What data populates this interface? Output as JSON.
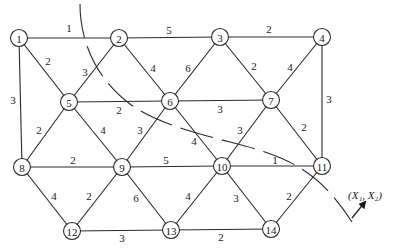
{
  "figure": {
    "type": "weighted-graph",
    "nodes": [
      {
        "id": "1",
        "x": 19,
        "y": 38
      },
      {
        "id": "2",
        "x": 119,
        "y": 38
      },
      {
        "id": "3",
        "x": 220,
        "y": 37
      },
      {
        "id": "4",
        "x": 322,
        "y": 37
      },
      {
        "id": "5",
        "x": 69,
        "y": 102
      },
      {
        "id": "6",
        "x": 170,
        "y": 101
      },
      {
        "id": "7",
        "x": 271,
        "y": 100
      },
      {
        "id": "8",
        "x": 22,
        "y": 167
      },
      {
        "id": "9",
        "x": 122,
        "y": 167
      },
      {
        "id": "10",
        "x": 222,
        "y": 166
      },
      {
        "id": "11",
        "x": 322,
        "y": 166
      },
      {
        "id": "12",
        "x": 72,
        "y": 231
      },
      {
        "id": "13",
        "x": 171,
        "y": 230
      },
      {
        "id": "14",
        "x": 271,
        "y": 229
      }
    ],
    "edges": [
      {
        "from": "1",
        "to": "2",
        "weight": "1",
        "lx": 69,
        "ly": 28
      },
      {
        "from": "2",
        "to": "3",
        "weight": "5",
        "lx": 169,
        "ly": 30
      },
      {
        "from": "3",
        "to": "4",
        "weight": "2",
        "lx": 269,
        "ly": 29
      },
      {
        "from": "1",
        "to": "5",
        "weight": "2",
        "lx": 48,
        "ly": 61
      },
      {
        "from": "2",
        "to": "5",
        "weight": "3",
        "lx": 85,
        "ly": 72
      },
      {
        "from": "2",
        "to": "6",
        "weight": "4",
        "lx": 153,
        "ly": 68
      },
      {
        "from": "3",
        "to": "6",
        "weight": "6",
        "lx": 188,
        "ly": 68
      },
      {
        "from": "3",
        "to": "7",
        "weight": "2",
        "lx": 254,
        "ly": 66
      },
      {
        "from": "4",
        "to": "7",
        "weight": "4",
        "lx": 290,
        "ly": 67
      },
      {
        "from": "1",
        "to": "8",
        "weight": "3",
        "lx": 13,
        "ly": 100
      },
      {
        "from": "4",
        "to": "11",
        "weight": "3",
        "lx": 329,
        "ly": 99
      },
      {
        "from": "5",
        "to": "6",
        "weight": "2",
        "lx": 119,
        "ly": 110
      },
      {
        "from": "6",
        "to": "7",
        "weight": "3",
        "lx": 220,
        "ly": 109
      },
      {
        "from": "5",
        "to": "8",
        "weight": "2",
        "lx": 39,
        "ly": 130
      },
      {
        "from": "5",
        "to": "9",
        "weight": "4",
        "lx": 103,
        "ly": 130
      },
      {
        "from": "6",
        "to": "9",
        "weight": "3",
        "lx": 140,
        "ly": 130
      },
      {
        "from": "6",
        "to": "10",
        "weight": "4",
        "lx": 194,
        "ly": 141
      },
      {
        "from": "7",
        "to": "10",
        "weight": "3",
        "lx": 240,
        "ly": 130
      },
      {
        "from": "7",
        "to": "11",
        "weight": "2",
        "lx": 304,
        "ly": 127
      },
      {
        "from": "8",
        "to": "9",
        "weight": "2",
        "lx": 73,
        "ly": 160
      },
      {
        "from": "9",
        "to": "10",
        "weight": "5",
        "lx": 166,
        "ly": 160
      },
      {
        "from": "10",
        "to": "11",
        "weight": "1",
        "lx": 275,
        "ly": 160
      },
      {
        "from": "8",
        "to": "12",
        "weight": "4",
        "lx": 54,
        "ly": 196
      },
      {
        "from": "9",
        "to": "12",
        "weight": "2",
        "lx": 89,
        "ly": 196
      },
      {
        "from": "9",
        "to": "13",
        "weight": "6",
        "lx": 136,
        "ly": 198
      },
      {
        "from": "10",
        "to": "13",
        "weight": "4",
        "lx": 188,
        "ly": 196
      },
      {
        "from": "10",
        "to": "14",
        "weight": "3",
        "lx": 236,
        "ly": 198
      },
      {
        "from": "11",
        "to": "14",
        "weight": "2",
        "lx": 289,
        "ly": 196
      },
      {
        "from": "12",
        "to": "13",
        "weight": "3",
        "lx": 122,
        "ly": 238
      },
      {
        "from": "13",
        "to": "14",
        "weight": "2",
        "lx": 221,
        "ly": 237
      }
    ],
    "cut_curve": {
      "style": "dashed",
      "path": "M 80 4 C 80 40, 95 78, 130 104 S 230 140, 265 152 S 325 180, 352 222"
    },
    "direction_arrow": {
      "label": "(X₁, X₂)",
      "from": [
        352,
        218
      ],
      "to": [
        365,
        202
      ],
      "label_x": 348,
      "label_y": 199
    }
  }
}
